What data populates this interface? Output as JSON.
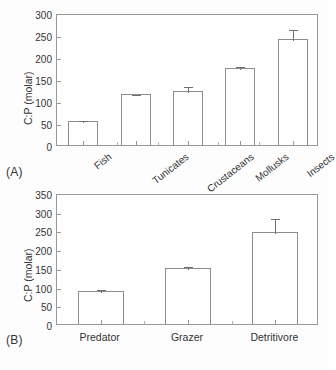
{
  "figure": {
    "panel_a_tag": "(A)",
    "panel_b_tag": "(B)"
  },
  "chart_data": [
    {
      "type": "bar",
      "panel": "(A)",
      "title": "",
      "xlabel": "",
      "ylabel": "C:P (molar)",
      "ylim": [
        0,
        300
      ],
      "yticks": [
        0,
        50,
        100,
        150,
        200,
        250,
        300
      ],
      "grid": false,
      "legend": "none",
      "xtick_rotation": -38,
      "categories": [
        "Fish",
        "Tunicates",
        "Crustaceans",
        "Mollusks",
        "Insects"
      ],
      "values": [
        55,
        117,
        122,
        175,
        242
      ],
      "errors": [
        4,
        2,
        15,
        6,
        24
      ]
    },
    {
      "type": "bar",
      "panel": "(B)",
      "title": "",
      "xlabel": "",
      "ylabel": "C:P (molar)",
      "ylim": [
        0,
        350
      ],
      "yticks": [
        0,
        50,
        100,
        150,
        200,
        250,
        300,
        350
      ],
      "grid": false,
      "legend": "none",
      "xtick_rotation": 0,
      "categories": [
        "Predator",
        "Grazer",
        "Detritivore"
      ],
      "values": [
        88,
        149,
        246
      ],
      "errors": [
        7,
        9,
        41
      ]
    }
  ]
}
